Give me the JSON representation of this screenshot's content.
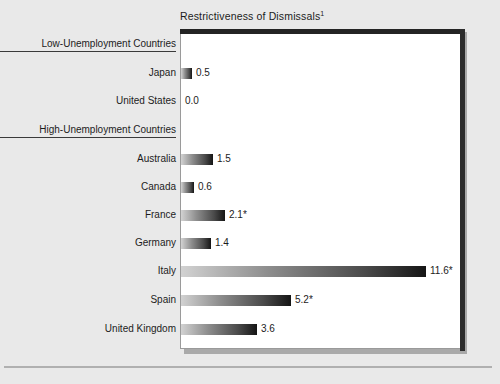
{
  "chart_data": {
    "type": "bar",
    "orientation": "horizontal",
    "title": "Restrictiveness of Dismissals",
    "title_superscript": "1",
    "xlabel": "",
    "ylabel": "",
    "grid": false,
    "legend": false,
    "xlim": [
      0,
      13.3
    ],
    "sections": [
      {
        "heading": "Low-Unemployment Countries",
        "categories": [
          "Japan",
          "United States"
        ],
        "values": [
          0.5,
          0.0
        ],
        "value_labels": [
          "0.5",
          "0.0"
        ]
      },
      {
        "heading": "High-Unemployment Countries",
        "categories": [
          "Australia",
          "Canada",
          "France",
          "Germany",
          "Italy",
          "Spain",
          "United Kingdom"
        ],
        "values": [
          1.5,
          0.6,
          2.1,
          1.4,
          11.6,
          5.2,
          3.6
        ],
        "value_labels": [
          "1.5",
          "0.6",
          "2.1*",
          "1.4",
          "11.6*",
          "5.2*",
          "3.6"
        ]
      }
    ],
    "categories": [
      "Japan",
      "United States",
      "Australia",
      "Canada",
      "France",
      "Germany",
      "Italy",
      "Spain",
      "United Kingdom"
    ],
    "values": [
      0.5,
      0.0,
      1.5,
      0.6,
      2.1,
      1.4,
      11.6,
      5.2,
      3.6
    ],
    "annotations": [
      "* denotes asterisked values on France, Italy and Spain"
    ]
  },
  "rows": [
    {
      "label": "Low-Unemployment Countries",
      "type": "section",
      "top": 36
    },
    {
      "label": "Japan",
      "type": "bar",
      "top": 64,
      "value": 0.5,
      "value_label": "0.5"
    },
    {
      "label": "United States",
      "type": "bar",
      "top": 92,
      "value": 0.0,
      "value_label": "0.0"
    },
    {
      "label": "High-Unemployment Countries",
      "type": "section",
      "top": 122
    },
    {
      "label": "Australia",
      "type": "bar",
      "top": 150,
      "value": 1.5,
      "value_label": "1.5"
    },
    {
      "label": "Canada",
      "type": "bar",
      "top": 178,
      "value": 0.6,
      "value_label": "0.6"
    },
    {
      "label": "France",
      "type": "bar",
      "top": 206,
      "value": 2.1,
      "value_label": "2.1*"
    },
    {
      "label": "Germany",
      "type": "bar",
      "top": 234,
      "value": 1.4,
      "value_label": "1.4"
    },
    {
      "label": "Italy",
      "type": "bar",
      "top": 262,
      "value": 11.6,
      "value_label": "11.6*"
    },
    {
      "label": "Spain",
      "type": "bar",
      "top": 291,
      "value": 5.2,
      "value_label": "5.2*"
    },
    {
      "label": "United Kingdom",
      "type": "bar",
      "top": 320,
      "value": 3.6,
      "value_label": "3.6"
    }
  ],
  "scale": {
    "px_per_unit": 21.1,
    "bar_origin_x": 181
  },
  "colors": {
    "page_background": "#e9e9e9",
    "plot_background": "#ffffff",
    "text": "#1c1c1c",
    "bar_gradient_start": "#d2d2d2",
    "bar_gradient_end": "#151515",
    "frame_edge": "#242424",
    "shadow": "#a9a9a9",
    "rule": "#b0b0b0"
  }
}
